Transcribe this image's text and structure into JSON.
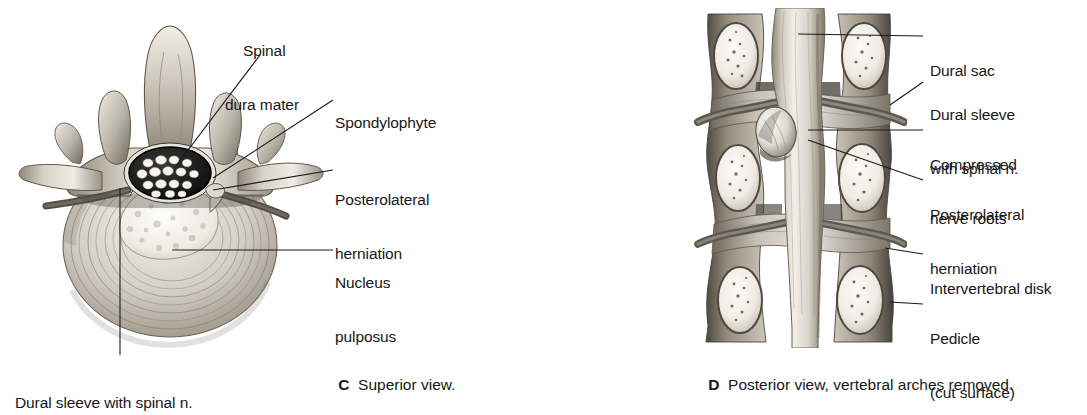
{
  "figure": {
    "type": "anatomical-illustration",
    "panels": [
      {
        "id": "C",
        "letter": "C",
        "caption": "Superior view.",
        "labels": [
          {
            "name": "spinal-dura-mater",
            "lines": [
              "Spinal",
              "dura mater"
            ]
          },
          {
            "name": "spondylophyte",
            "lines": [
              "Spondylophyte"
            ]
          },
          {
            "name": "posterolateral-herniation",
            "lines": [
              "Posterolateral",
              "herniation"
            ]
          },
          {
            "name": "nucleus-pulposus",
            "lines": [
              "Nucleus",
              "pulposus"
            ]
          },
          {
            "name": "dural-sleeve-with-spinal-n",
            "lines": [
              "Dural sleeve with spinal n."
            ]
          }
        ]
      },
      {
        "id": "D",
        "letter": "D",
        "caption": "Posterior view, vertebral arches removed.",
        "labels": [
          {
            "name": "dural-sac",
            "lines": [
              "Dural sac"
            ]
          },
          {
            "name": "dural-sleeve-with-spinal-n",
            "lines": [
              "Dural sleeve",
              "with spinal n."
            ]
          },
          {
            "name": "compressed-nerve-roots",
            "lines": [
              "Compressed",
              "nerve roots"
            ]
          },
          {
            "name": "posterolateral-herniation",
            "lines": [
              "Posterolateral",
              "herniation"
            ]
          },
          {
            "name": "intervertebral-disk",
            "lines": [
              "Intervertebral disk"
            ]
          },
          {
            "name": "pedicle-cut-surface",
            "lines": [
              "Pedicle",
              "(cut surface)"
            ]
          }
        ]
      }
    ]
  },
  "panelC": {
    "label_spinal_1": "Spinal",
    "label_spinal_2": "dura mater",
    "label_spondylophyte": "Spondylophyte",
    "label_posterolateral_1": "Posterolateral",
    "label_posterolateral_2": "herniation",
    "label_nucleus_1": "Nucleus",
    "label_nucleus_2": "pulposus",
    "label_dural_sleeve": "Dural sleeve with spinal n.",
    "caption_letter": "C",
    "caption_text": "Superior view."
  },
  "panelD": {
    "label_dural_sac": "Dural sac",
    "label_dural_sleeve_1": "Dural sleeve",
    "label_dural_sleeve_2": "with spinal n.",
    "label_compressed_1": "Compressed",
    "label_compressed_2": "nerve roots",
    "label_posterolateral_1": "Posterolateral",
    "label_posterolateral_2": "herniation",
    "label_intervertebral_disk": "Intervertebral disk",
    "label_pedicle_1": "Pedicle",
    "label_pedicle_2": "(cut surface)",
    "caption_letter": "D",
    "caption_text": "Posterior view, vertebral arches removed."
  },
  "colors": {
    "background": "#ffffff",
    "text": "#171717",
    "leader_line": "#1a1a1a",
    "bone_light": "#e9e5df",
    "bone_mid": "#b9b2a8",
    "bone_dark": "#7d7669",
    "dura_dark": "#1d1d1d",
    "nerve_white": "#f5f3ee",
    "disk_light": "#dedad2",
    "shadow": "#4a453d"
  }
}
